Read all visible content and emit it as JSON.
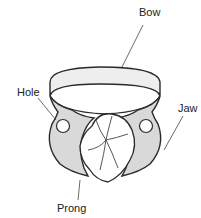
{
  "diagram": {
    "labels": {
      "bow": "Bow",
      "hole": "Hole",
      "jaw": "Jaw",
      "prong": "Prong"
    },
    "colors": {
      "outline": "#2a2a2a",
      "jaw_fill": "#d9d9d9",
      "bow_fill": "#eeeeee",
      "tooth_fill": "#ffffff",
      "leader": "#444444"
    }
  }
}
